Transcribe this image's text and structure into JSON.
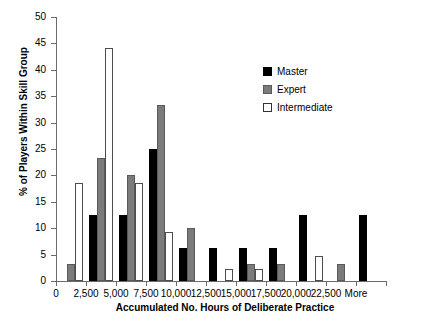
{
  "chart_data": {
    "type": "bar",
    "title": "",
    "xlabel": "Accumulated No. Hours of Deliberate Practice",
    "ylabel": "% of Players Within Skill Group",
    "categories": [
      "0",
      "2,500",
      "5,000",
      "7,500",
      "10,000",
      "12,500",
      "15,000",
      "17,500",
      "20,000",
      "22,500",
      "More"
    ],
    "series": [
      {
        "name": "Master",
        "color": "#000000",
        "values": [
          0,
          12.5,
          12.5,
          25.0,
          6.3,
          6.3,
          6.3,
          6.3,
          12.5,
          0,
          12.5
        ]
      },
      {
        "name": "Expert",
        "color": "#7b7b7b",
        "values": [
          3.3,
          23.3,
          20.0,
          33.3,
          10.0,
          0,
          3.3,
          3.3,
          0,
          3.3,
          0
        ]
      },
      {
        "name": "Intermediate",
        "color": "#ffffff",
        "values": [
          18.6,
          44.2,
          18.6,
          9.3,
          0,
          2.3,
          2.3,
          0,
          4.7,
          0,
          0
        ]
      }
    ],
    "ylim": [
      0,
      50
    ],
    "yticks": [
      0,
      5,
      10,
      15,
      20,
      25,
      30,
      35,
      40,
      45,
      50
    ],
    "ytick_labels": [
      "0",
      "5",
      "10",
      "15",
      "20",
      "25",
      "30",
      "35",
      "40",
      "45",
      "50"
    ],
    "grid": false,
    "legend_position": "top-right",
    "legend": [
      "Master",
      "Expert",
      "Intermediate"
    ]
  }
}
